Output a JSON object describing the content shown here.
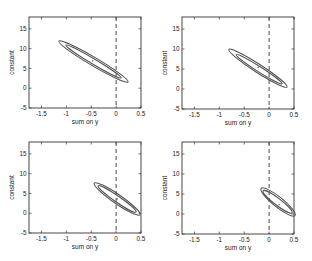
{
  "figure": {
    "layout": "2x2 grid",
    "colors": {
      "ellipse": "#555555",
      "axes": "#333333",
      "dashed_line": "#333333",
      "background": "#ffffff"
    }
  },
  "chart_data": [
    {
      "type": "scatter",
      "title": "",
      "xlabel": "sum on y",
      "ylabel": "constant",
      "xlim": [
        -1.75,
        0.5
      ],
      "ylim": [
        -5,
        18
      ],
      "xticks": [
        -1.5,
        -1,
        -0.5,
        0,
        0.5
      ],
      "xtick_labels": [
        "-1.5",
        "-1",
        "-0.5",
        "0",
        "0.5"
      ],
      "yticks": [
        -5,
        0,
        5,
        10,
        15
      ],
      "ytick_labels": [
        "-5",
        "0",
        "5",
        "10",
        "15"
      ],
      "grid": false,
      "vline": {
        "x": 0,
        "style": "dashed"
      },
      "center": {
        "x": -0.47,
        "y": 6.9
      },
      "ellipses": [
        {
          "name": "outer",
          "p1": [
            -1.15,
            11.9
          ],
          "p2": [
            0.24,
            1.6
          ],
          "halfwidth_px": 4.2
        },
        {
          "name": "inner",
          "p1": [
            -1.01,
            10.9
          ],
          "p2": [
            0.1,
            2.6
          ],
          "halfwidth_px": 2.6
        }
      ]
    },
    {
      "type": "scatter",
      "title": "",
      "xlabel": "sum on y",
      "ylabel": "constant",
      "xlim": [
        -1.75,
        0.5
      ],
      "ylim": [
        -5,
        18
      ],
      "xticks": [
        -1.5,
        -1,
        -0.5,
        0,
        0.5
      ],
      "xtick_labels": [
        "-1.5",
        "-1",
        "-0.5",
        "0",
        "0.5"
      ],
      "yticks": [
        -5,
        0,
        5,
        10,
        15
      ],
      "ytick_labels": [
        "-5",
        "0",
        "5",
        "10",
        "15"
      ],
      "grid": false,
      "vline": {
        "x": 0,
        "style": "dashed"
      },
      "center": {
        "x": -0.22,
        "y": 5.4
      },
      "ellipses": [
        {
          "name": "outer",
          "p1": [
            -0.81,
            9.9
          ],
          "p2": [
            0.36,
            0.5
          ],
          "halfwidth_px": 4.2
        },
        {
          "name": "inner",
          "p1": [
            -0.66,
            8.6
          ],
          "p2": [
            0.26,
            1.3
          ],
          "halfwidth_px": 2.6
        }
      ]
    },
    {
      "type": "scatter",
      "title": "",
      "xlabel": "sum on y",
      "ylabel": "constant",
      "xlim": [
        -1.75,
        0.5
      ],
      "ylim": [
        -5,
        18
      ],
      "xticks": [
        -1.5,
        -1,
        -0.5,
        0,
        0.5
      ],
      "xtick_labels": [
        "-1.5",
        "-1",
        "-0.5",
        "0",
        "0.5"
      ],
      "yticks": [
        -5,
        0,
        5,
        10,
        15
      ],
      "ytick_labels": [
        "-5",
        "0",
        "5",
        "10",
        "15"
      ],
      "grid": false,
      "vline": {
        "x": 0,
        "style": "dashed"
      },
      "center": {
        "x": 0.02,
        "y": 3.6
      },
      "ellipses": [
        {
          "name": "outer",
          "p1": [
            -0.44,
            7.6
          ],
          "p2": [
            0.48,
            -0.4
          ],
          "halfwidth_px": 4.6
        },
        {
          "name": "inner",
          "p1": [
            -0.36,
            6.9
          ],
          "p2": [
            0.4,
            0.3
          ],
          "halfwidth_px": 3.0
        }
      ]
    },
    {
      "type": "scatter",
      "title": "",
      "xlabel": "sum on y",
      "ylabel": "constant",
      "xlim": [
        -1.75,
        0.5
      ],
      "ylim": [
        -5,
        18
      ],
      "xticks": [
        -1.5,
        -1,
        -0.5,
        0,
        0.5
      ],
      "xtick_labels": [
        "-1.5",
        "-1",
        "-0.5",
        "0",
        "0.5"
      ],
      "yticks": [
        -5,
        0,
        5,
        10,
        15
      ],
      "ytick_labels": [
        "-5",
        "0",
        "5",
        "10",
        "15"
      ],
      "grid": false,
      "vline": {
        "x": 0,
        "style": "dashed"
      },
      "center": {
        "x": 0.2,
        "y": 2.3
      },
      "ellipses": [
        {
          "name": "outer",
          "p1": [
            -0.16,
            6.4
          ],
          "p2": [
            0.52,
            -0.4
          ],
          "halfwidth_px": 5.0
        },
        {
          "name": "inner",
          "p1": [
            -0.12,
            5.8
          ],
          "p2": [
            0.46,
            0.3
          ],
          "halfwidth_px": 3.4
        }
      ]
    }
  ]
}
